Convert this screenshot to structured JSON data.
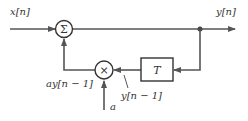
{
  "diagram": {
    "input_label": "x[n]",
    "output_label": "y[n]",
    "summer_symbol": "Σ",
    "multiplier_symbol": "×",
    "delay_label": "T",
    "delayed_output_label": "y[n − 1]",
    "scaled_feedback_label": "ay[n − 1]",
    "coefficient_label": "a",
    "colors": {
      "line": "#555555",
      "stroke": "#333333",
      "background": "#ffffff"
    }
  }
}
